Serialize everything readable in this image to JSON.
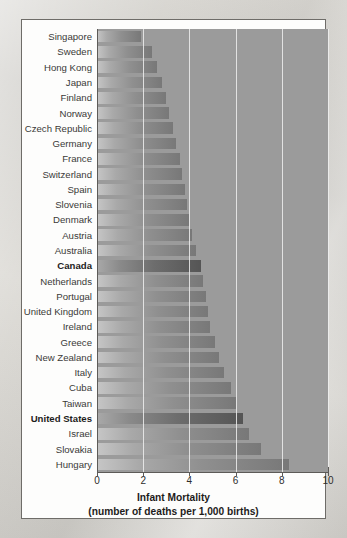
{
  "chart_data": {
    "type": "bar",
    "orientation": "horizontal",
    "title": "",
    "xlabel": "Infant Mortality",
    "xlabel_sub": "(number of deaths per 1,000 births)",
    "ylabel": "",
    "xlim": [
      0,
      10
    ],
    "xticks": [
      0,
      2,
      4,
      6,
      8,
      10
    ],
    "xtick_labels": [
      "0",
      "2",
      "4",
      "6",
      "8",
      "10"
    ],
    "grid": true,
    "grid_axis": "x",
    "legend": "none",
    "highlight_color": "#5a5a5a",
    "bar_color": "#8f8f8f",
    "plot_background": "#9b9b9b",
    "categories": [
      "Singapore",
      "Sweden",
      "Hong Kong",
      "Japan",
      "Finland",
      "Norway",
      "Czech Republic",
      "Germany",
      "France",
      "Switzerland",
      "Spain",
      "Slovenia",
      "Denmark",
      "Austria",
      "Australia",
      "Canada",
      "Netherlands",
      "Portugal",
      "United Kingdom",
      "Ireland",
      "Greece",
      "New Zealand",
      "Italy",
      "Cuba",
      "Taiwan",
      "United States",
      "Israel",
      "Slovakia",
      "Hungary"
    ],
    "values": [
      1.9,
      2.4,
      2.6,
      2.8,
      3.0,
      3.1,
      3.3,
      3.4,
      3.6,
      3.7,
      3.8,
      3.9,
      4.0,
      4.1,
      4.3,
      4.5,
      4.6,
      4.7,
      4.8,
      4.9,
      5.1,
      5.3,
      5.5,
      5.8,
      6.0,
      6.3,
      6.6,
      7.1,
      8.3
    ],
    "highlighted": [
      "Canada",
      "United States"
    ]
  }
}
